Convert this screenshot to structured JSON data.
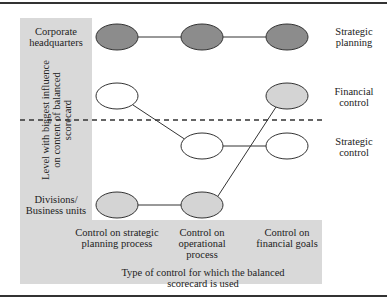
{
  "figure": {
    "y_axis_title": "Level with biggest influence on content of balanced scorecard",
    "x_axis_title": "Type of control for which the balanced scorecard is used",
    "rows": [
      {
        "label": "Corporate headquarters"
      },
      {
        "label": "Divisions/ Business units"
      }
    ],
    "columns": [
      {
        "label": "Control on strategic planning process"
      },
      {
        "label": "Control on operational process"
      },
      {
        "label": "Control on financial goals"
      }
    ],
    "series_labels": [
      {
        "label": "Strategic planning"
      },
      {
        "label": "Financial control"
      },
      {
        "label": "Strategic control"
      }
    ],
    "colors": {
      "dark_node": "#8c8c8c",
      "light_node": "#d4d4d4",
      "empty_node": "#ffffff",
      "panel": "#d9d9d9",
      "line": "#333333"
    }
  }
}
